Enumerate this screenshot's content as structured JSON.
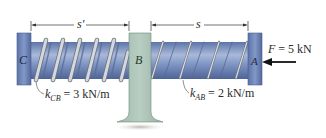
{
  "figure": {
    "dimensions": {
      "s_prime": "s′",
      "s": "s"
    },
    "points": {
      "C": "C",
      "B": "B",
      "A": "A"
    },
    "force": {
      "label": "F = 5 kN",
      "direction": "left"
    },
    "springs": {
      "CB": {
        "k_symbol": "k",
        "subscript": "CB",
        "value": "= 3 kN/m"
      },
      "AB": {
        "k_symbol": "k",
        "subscript": "AB",
        "value": "= 2 kN/m"
      }
    },
    "colors": {
      "rod": "#6f86b6",
      "rod_light": "#a9b9d9",
      "block": "#6d86b8",
      "wall": "#a8c0b4",
      "spring": "#c9cdd4",
      "spring_edge": "#6e737c",
      "ink": "#2a2a2a"
    }
  }
}
